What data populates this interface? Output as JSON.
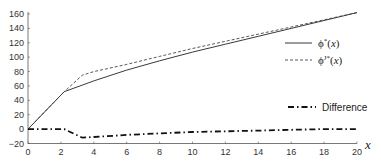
{
  "chart_data": {
    "type": "line",
    "title": "",
    "xlabel": "x",
    "ylabel": "",
    "xlim": [
      0,
      20
    ],
    "ylim": [
      -20,
      160
    ],
    "grid": false,
    "legend_position": "right",
    "x_ticks": [
      0,
      2,
      4,
      6,
      8,
      10,
      12,
      14,
      16,
      18,
      20
    ],
    "y_ticks": [
      -20,
      0,
      20,
      40,
      60,
      80,
      100,
      120,
      140,
      160
    ],
    "series": [
      {
        "name": "φ*(x)",
        "style": "solid",
        "x": [
          0,
          2.2,
          4,
          6,
          8,
          10,
          12,
          14,
          16,
          18,
          20
        ],
        "values": [
          0,
          52,
          67,
          82,
          95,
          107,
          118,
          129,
          140,
          151,
          162
        ]
      },
      {
        "name": "φ^{J*}(x)",
        "style": "dashed",
        "x": [
          0,
          2.2,
          3.3,
          4,
          6,
          8,
          10,
          12,
          14,
          16,
          18,
          20
        ],
        "values": [
          0,
          52,
          75,
          80,
          90,
          101,
          112,
          122,
          132,
          142,
          152,
          162
        ]
      },
      {
        "name": "Difference",
        "style": "dash-dot",
        "x": [
          0,
          2.2,
          3.3,
          4,
          6,
          8,
          10,
          12,
          14,
          16,
          18,
          20
        ],
        "values": [
          0,
          0,
          -12,
          -11,
          -8,
          -6,
          -4,
          -3,
          -2,
          -1,
          0,
          0
        ]
      }
    ]
  },
  "legend": {
    "entry1": "ϕ*(x)",
    "entry2": "ϕJ*(x)",
    "entry3": "Difference"
  }
}
